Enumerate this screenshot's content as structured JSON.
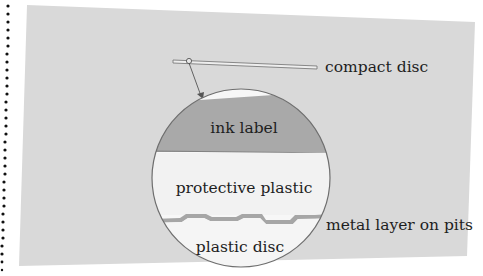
{
  "diagram": {
    "labels": {
      "compact_disc": "compact disc",
      "ink_label": "ink label",
      "protective_plastic": "protective plastic",
      "metal_layer": "metal layer on pits",
      "plastic_disc": "plastic disc"
    },
    "colors": {
      "page": "#ffffff",
      "panel": "#d9d9d9",
      "ink_label_fill": "#a9a9a9",
      "plastic_fill": "#f2f2f2",
      "metal_fill": "#a6a6a6",
      "outline": "#6e6e6e",
      "text": "#1e1e1e",
      "binding_dots": "#111111"
    }
  }
}
